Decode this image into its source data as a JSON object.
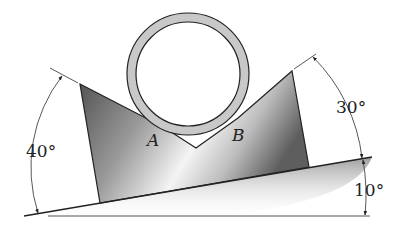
{
  "diagram": {
    "points": {
      "contact_a": "A",
      "contact_b": "B"
    },
    "angles": {
      "left_face": "40°",
      "right_face": "30°",
      "incline": "10°"
    },
    "colors": {
      "block_dark": "#5a5a5a",
      "block_light": "#f2f2f2",
      "pipe_ring": "#c8c8c8",
      "outline": "#222222",
      "ground_shadow": "#9a9a9a"
    }
  }
}
